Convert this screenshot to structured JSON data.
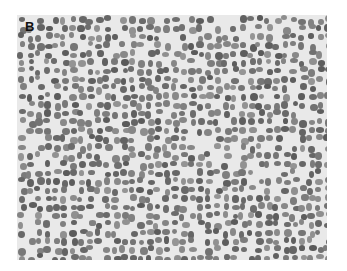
{
  "figure": {
    "panel_label": "B",
    "background_color": "#e9e9e9",
    "nucleus_color": "#7a7a7a"
  }
}
